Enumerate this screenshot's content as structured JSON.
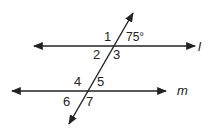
{
  "diagram": {
    "lines": [
      {
        "id": "l",
        "label": "l"
      },
      {
        "id": "m",
        "label": "m"
      }
    ],
    "angle_labels": {
      "a1": "1",
      "a75": "75°",
      "a2": "2",
      "a3": "3",
      "a4": "4",
      "a5": "5",
      "a6": "6",
      "a7": "7"
    },
    "given_angle_degrees": 75,
    "stroke_color": "#222222"
  }
}
